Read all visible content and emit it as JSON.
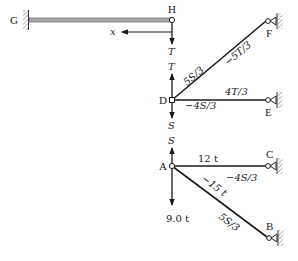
{
  "nodes": {
    "G": "G",
    "H": "H",
    "F": "F",
    "D": "D",
    "E": "E",
    "A": "A",
    "C": "C",
    "B": "B"
  },
  "beam_gh": {
    "axis_label": "x",
    "force_at_h": "T"
  },
  "joint_d": {
    "force_up": "T",
    "force_down": "S",
    "member_df_labels": [
      "5S/3",
      "−5T/3"
    ],
    "member_de_labels": [
      "4T/3",
      "−4S/3"
    ]
  },
  "joint_a": {
    "force_up": "S",
    "load_down": "9.0 t",
    "member_ac_labels": [
      "12 t",
      "−4S/3"
    ],
    "member_ab_labels": [
      "−15 t",
      "5S/3"
    ]
  },
  "colors": {
    "member": "#1a1a1a",
    "beam": "#8a8a8a",
    "hatch": "#9a9a9a"
  }
}
